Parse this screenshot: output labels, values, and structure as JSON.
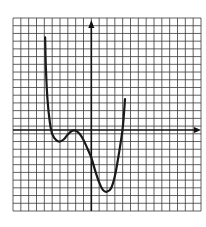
{
  "chart_data": {
    "type": "line",
    "title": "",
    "xlabel": "",
    "ylabel": "",
    "grid": true,
    "grid_cells": {
      "cols": 24,
      "rows": 25
    },
    "origin_cell": {
      "col": 10,
      "row": 14.5
    },
    "xlim": [
      -10,
      14
    ],
    "ylim": [
      -10.5,
      14.5
    ],
    "axis_arrows": {
      "x": "right",
      "y": "up"
    },
    "legend": null,
    "series": [
      {
        "name": "curve",
        "color": "#1a1a1a",
        "points": [
          [
            -5.9,
            12.0
          ],
          [
            -5.8,
            8.0
          ],
          [
            -5.6,
            4.0
          ],
          [
            -5.3,
            1.0
          ],
          [
            -5.0,
            -0.5
          ],
          [
            -4.5,
            -1.3
          ],
          [
            -4.0,
            -1.5
          ],
          [
            -3.5,
            -1.2
          ],
          [
            -3.0,
            -0.6
          ],
          [
            -2.5,
            -0.15
          ],
          [
            -2.0,
            -0.1
          ],
          [
            -1.5,
            -0.5
          ],
          [
            -1.0,
            -1.3
          ],
          [
            -0.5,
            -2.4
          ],
          [
            0.0,
            -3.6
          ],
          [
            0.5,
            -5.3
          ],
          [
            1.0,
            -6.8
          ],
          [
            1.5,
            -7.8
          ],
          [
            2.0,
            -8.0
          ],
          [
            2.5,
            -7.6
          ],
          [
            3.0,
            -6.0
          ],
          [
            3.5,
            -3.2
          ],
          [
            4.0,
            0.2
          ],
          [
            4.3,
            4.0
          ]
        ]
      }
    ]
  }
}
